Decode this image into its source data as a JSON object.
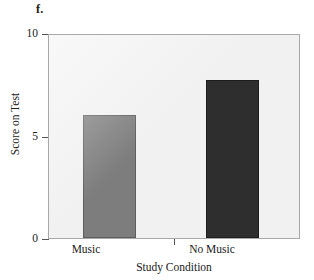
{
  "panel": {
    "letter": "f."
  },
  "chart_data": {
    "type": "bar",
    "title": "",
    "xlabel": "Study Condition",
    "ylabel": "Score on Test",
    "categories": [
      "Music",
      "No Music"
    ],
    "values": [
      6,
      7.7
    ],
    "series": [
      {
        "name": "Score on Test",
        "values": [
          6,
          7.7
        ]
      }
    ],
    "ylim": [
      0,
      10
    ],
    "yticks": [
      0,
      5,
      10
    ],
    "ytick_labels": [
      "0",
      "5",
      "10"
    ],
    "grid": false,
    "legend": "none",
    "bar_colors": [
      "#7d7d7d",
      "#2e2e2e"
    ],
    "plot_background": "#f1f1f1",
    "axis_color": "#a8a8a8"
  }
}
